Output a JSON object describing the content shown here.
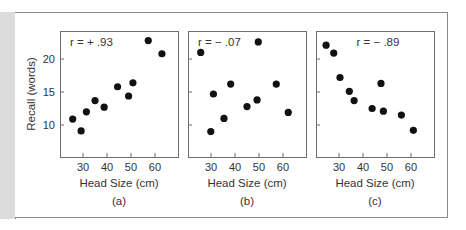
{
  "figure": {
    "ylabel": "Recall (words)",
    "xlabel": "Head Size (cm)"
  },
  "chart_data": [
    {
      "type": "scatter",
      "panel_label": "(a)",
      "annotation": "r =  + .93",
      "correlation": 0.93,
      "xlabel": "Head Size (cm)",
      "ylabel": "Recall (words)",
      "xticks": [
        30,
        40,
        50,
        60
      ],
      "yticks": [
        10,
        15,
        20
      ],
      "xlim": [
        20.4,
        69.6
      ],
      "ylim": [
        5.15,
        24.25
      ],
      "grid": false,
      "points": [
        {
          "x": 25.7,
          "y": 10.9
        },
        {
          "x": 29.2,
          "y": 9.1
        },
        {
          "x": 31.4,
          "y": 12.0
        },
        {
          "x": 35.0,
          "y": 13.7
        },
        {
          "x": 38.8,
          "y": 12.7
        },
        {
          "x": 44.4,
          "y": 15.8
        },
        {
          "x": 49.0,
          "y": 14.4
        },
        {
          "x": 50.8,
          "y": 16.4
        },
        {
          "x": 57.2,
          "y": 22.8
        },
        {
          "x": 62.9,
          "y": 20.8
        }
      ]
    },
    {
      "type": "scatter",
      "panel_label": "(b)",
      "annotation": "r =  − .07",
      "correlation": -0.07,
      "xlabel": "Head Size (cm)",
      "ylabel": "",
      "xticks": [
        30,
        40,
        50,
        60
      ],
      "yticks": [
        10,
        15,
        20
      ],
      "xlim": [
        20.4,
        69.6
      ],
      "ylim": [
        5.15,
        24.25
      ],
      "grid": false,
      "points": [
        {
          "x": 25.7,
          "y": 21.0
        },
        {
          "x": 29.9,
          "y": 9.0
        },
        {
          "x": 31.0,
          "y": 14.7
        },
        {
          "x": 35.4,
          "y": 11.0
        },
        {
          "x": 38.2,
          "y": 16.2
        },
        {
          "x": 45.0,
          "y": 12.8
        },
        {
          "x": 49.2,
          "y": 13.8
        },
        {
          "x": 49.7,
          "y": 22.6
        },
        {
          "x": 57.2,
          "y": 16.2
        },
        {
          "x": 62.2,
          "y": 11.9
        }
      ]
    },
    {
      "type": "scatter",
      "panel_label": "(c)",
      "annotation": "r =  − .89",
      "correlation": -0.89,
      "xlabel": "Head Size (cm)",
      "ylabel": "",
      "xticks": [
        30,
        40,
        50,
        60
      ],
      "yticks": [
        10,
        15,
        20
      ],
      "xlim": [
        20.4,
        69.6
      ],
      "ylim": [
        5.15,
        24.25
      ],
      "grid": false,
      "points": [
        {
          "x": 24.6,
          "y": 22.1
        },
        {
          "x": 27.8,
          "y": 20.9
        },
        {
          "x": 30.4,
          "y": 17.2
        },
        {
          "x": 34.3,
          "y": 15.1
        },
        {
          "x": 36.3,
          "y": 13.7
        },
        {
          "x": 43.8,
          "y": 12.5
        },
        {
          "x": 47.5,
          "y": 16.3
        },
        {
          "x": 48.5,
          "y": 12.1
        },
        {
          "x": 56.0,
          "y": 11.5
        },
        {
          "x": 61.0,
          "y": 9.2
        }
      ]
    }
  ]
}
